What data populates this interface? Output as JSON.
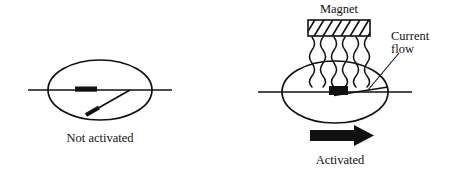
{
  "figure": {
    "title_visible": false,
    "background_color": "#ffffff",
    "stroke_color": "#111111",
    "fill_color": "#111111",
    "panels": [
      {
        "id": "not-activated",
        "caption": "Not activated",
        "state": "open",
        "description_visible_text": "Not activated"
      },
      {
        "id": "activated",
        "caption": "Activated",
        "state": "closed",
        "description_visible_text": "Activated"
      }
    ],
    "labels": {
      "magnet": "Magnet",
      "current_flow_line1": "Current",
      "current_flow_line2": "flow",
      "not_activated": "Not activated",
      "activated": "Activated"
    },
    "icons": {
      "magnet_block": "hatched-rectangle-icon",
      "field_lines": "wavy-line-icon",
      "direction_arrow": "right-arrow-icon",
      "leader": "leader-line-icon"
    },
    "counts": {
      "field_lines": 6,
      "magnet_hatch_lines": 7
    },
    "geometry": {
      "left_ellipse": {
        "cx": 100,
        "cy": 90,
        "rx": 52,
        "ry": 30
      },
      "right_ellipse": {
        "cx": 335,
        "cy": 92,
        "rx": 53,
        "ry": 31
      },
      "left_wire_y": 90,
      "right_wire_y": 92,
      "magnet_rect": {
        "x": 308,
        "y": 20,
        "w": 62,
        "h": 16
      },
      "arrow": {
        "x": 310,
        "y": 127,
        "w": 62,
        "h": 17
      }
    }
  }
}
